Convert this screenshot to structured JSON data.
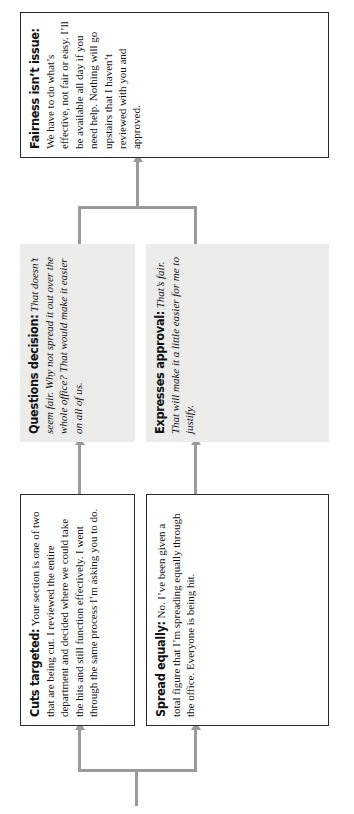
{
  "diagram": {
    "type": "flowchart",
    "orientation": "rotated-90-ccw",
    "title": "",
    "nodes": [
      {
        "id": "cuts-targeted",
        "lead": "Cuts targeted:",
        "body": " Your section is one of two that are being cut. I reviewed the entire department and decided where we could take the hits and still function effectively. I went through the same process I’m asking you to do.",
        "style": "plain",
        "italic": false
      },
      {
        "id": "questions-decision",
        "lead": "Questions decision:",
        "body": " That doesn’t seem fair. Why not spread it out over the whole office? That would make it easier on all of us.",
        "style": "shaded",
        "italic": true
      },
      {
        "id": "spread-equally",
        "lead": "Spread equally:",
        "body": " No. I’ve been given a total figure that I’m spreading equally through the office. Everyone is being hit.",
        "style": "plain",
        "italic": false
      },
      {
        "id": "expresses-approval",
        "lead": "Expresses approval:",
        "body": " That’s fair. That will make it a little easier for me to justify.",
        "style": "shaded",
        "italic": true
      },
      {
        "id": "fairness-isnt-issue",
        "lead": "Fairness isn’t issue:",
        "body": " We have to do what’s effective, not fair or easy. I’ll be available all day if you need help. Nothing will go upstairs that I haven’t reviewed with you and approved.",
        "style": "plain",
        "italic": false
      }
    ],
    "colors": {
      "connector": "#9a9a9a",
      "box_border": "#2a2a2a",
      "shaded_fill": "#ececeb",
      "text": "#111111",
      "page_background": "#ffffff"
    }
  }
}
